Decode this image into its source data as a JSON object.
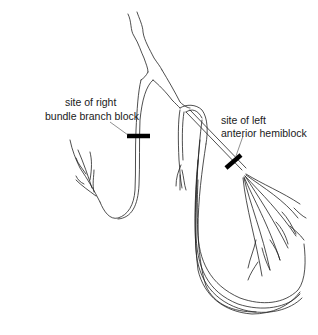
{
  "diagram": {
    "labels": {
      "right_block": {
        "line1": "site of right",
        "line2": "bundle branch block"
      },
      "left_block": {
        "line1": "site of left",
        "line2": "anterior hemiblock"
      }
    },
    "colors": {
      "line": "#222222",
      "block_marker": "#000000",
      "background": "#ffffff"
    }
  }
}
